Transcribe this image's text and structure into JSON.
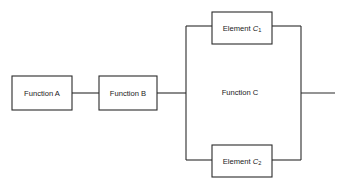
{
  "diagram": {
    "type": "block-diagram",
    "background_color": "#ffffff",
    "line_color": "#2b2b2b",
    "text_color": "#1a1a1a",
    "blocks": [
      {
        "id": "function-a",
        "label": "Function A",
        "x": 12,
        "y": 76,
        "width": 60,
        "height": 34
      },
      {
        "id": "function-b",
        "label": "Function B",
        "x": 99,
        "y": 76,
        "width": 58,
        "height": 34
      },
      {
        "id": "element-c1",
        "label_prefix": "Element ",
        "label_var": "C",
        "label_sub": "1",
        "x": 212,
        "y": 12,
        "width": 60,
        "height": 32
      },
      {
        "id": "element-c2",
        "label_prefix": "Element ",
        "label_var": "C",
        "label_sub": "2",
        "x": 212,
        "y": 145,
        "width": 60,
        "height": 32
      }
    ],
    "regions": [
      {
        "id": "function-c",
        "label": "Function C",
        "label_x": 240,
        "label_y": 93,
        "left_rail_x": 186,
        "right_rail_x": 301,
        "top_branch_y": 26,
        "bottom_branch_y": 160
      }
    ],
    "connections": [
      {
        "id": "input-to-a",
        "points": "72,93 99,93"
      },
      {
        "id": "b-to-left-rail",
        "points": "157,93 186,93"
      },
      {
        "id": "left-rail",
        "points": "186,26 186,160"
      },
      {
        "id": "top-branch-left",
        "points": "186,26 212,26"
      },
      {
        "id": "top-branch-right",
        "points": "272,26 301,26"
      },
      {
        "id": "bottom-branch-left",
        "points": "186,160 212,160"
      },
      {
        "id": "bottom-branch-right",
        "points": "272,160 301,160"
      },
      {
        "id": "right-rail",
        "points": "301,26 301,160"
      },
      {
        "id": "output-line",
        "points": "301,93 335,93"
      }
    ]
  }
}
